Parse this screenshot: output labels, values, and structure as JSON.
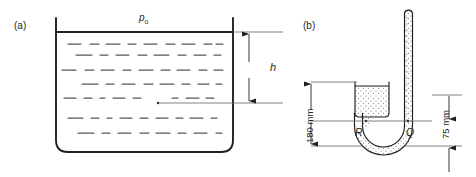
{
  "figure": {
    "type": "engineering-diagram",
    "background": "#ffffff",
    "line_color": "#231f20",
    "panels": [
      {
        "id": "a",
        "label": "(a)",
        "label_x": 14,
        "label_y": 21,
        "tank": {
          "name": "open-liquid-tank",
          "left": 56,
          "right": 233,
          "wall_top": 18,
          "surface_y": 32,
          "bottom_y": 152,
          "corner_radius": 12,
          "liquid_fill_pattern": "dashed-horizontal-lines"
        },
        "pressure_label": {
          "name": "surface-pressure-label",
          "text": "p",
          "subscript": "o",
          "x": 139,
          "y": 18
        },
        "point_marker": {
          "name": "depth-point",
          "x": 158,
          "y": 103
        },
        "dimension": {
          "name": "depth-dimension-h",
          "label": "h",
          "label_x": 272,
          "label_y": 73,
          "line_x": 249,
          "top_y": 32,
          "bottom_y": 103,
          "ext_top_from": 233,
          "ext_top_to": 283,
          "ext_bottom_from": 158,
          "ext_bottom_to": 283
        }
      },
      {
        "id": "b",
        "label": "(b)",
        "label_x": 303,
        "label_y": 21,
        "manometer": {
          "name": "u-tube-manometer",
          "reservoir": {
            "name": "manometer-reservoir",
            "left": 355,
            "right": 389,
            "top": 82,
            "bottom": 117,
            "corner_radius": 4,
            "fill_pattern": "stipple-dots"
          },
          "tube": {
            "name": "manometer-tube",
            "left_leg_x": 366,
            "right_leg_x": 404,
            "tube_width": 9,
            "top_y": 8,
            "cap": "rounded",
            "bend_center_y": 126,
            "bend_radius": 19,
            "fill_pattern": "stipple-dots"
          },
          "points": [
            {
              "name": "point-R",
              "label": "R",
              "x": 358,
              "y": 133
            },
            {
              "name": "point-Q",
              "label": "Q",
              "x": 408,
              "y": 133
            }
          ]
        },
        "dimensions": [
          {
            "name": "dimension-180mm",
            "label": "180 mm",
            "orientation": "vertical",
            "line_x": 311,
            "top_y": 82,
            "bottom_y": 144,
            "label_x": 308,
            "label_y": 141,
            "ext_top_from": 311,
            "ext_top_to": 357,
            "ext_bottom_from": 311,
            "ext_bottom_to": 360
          },
          {
            "name": "dimension-75mm",
            "label": "75 mm",
            "orientation": "vertical",
            "line_x": 449,
            "top_y": 95,
            "bottom_y": 122,
            "label_x": 443,
            "label_y": 137,
            "ext_top_from": 432,
            "ext_top_to": 458,
            "ext_bottom_from": 404,
            "ext_bottom_to": 458
          },
          {
            "name": "dimension-lower-arrow",
            "orientation": "vertical",
            "line_x": 449,
            "top_y": 145,
            "bottom_y": 172,
            "ext_top_from": 362,
            "ext_top_to": 458
          }
        ]
      }
    ]
  }
}
